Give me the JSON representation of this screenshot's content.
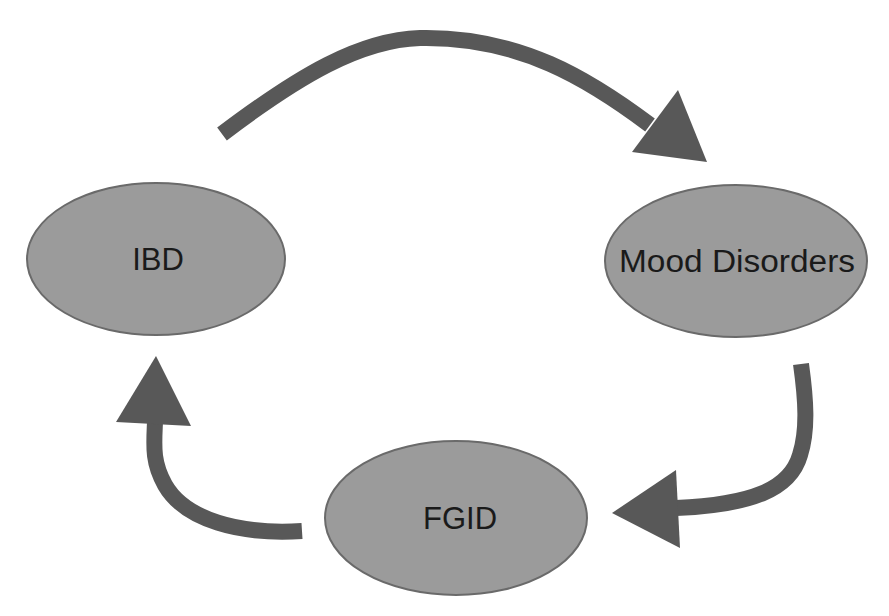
{
  "diagram": {
    "type": "cycle",
    "colors": {
      "node_fill": "#9b9b9b",
      "node_stroke": "#6a6a6a",
      "arrow": "#585858",
      "text": "#1a1a1a",
      "background": "#ffffff"
    },
    "nodes": [
      {
        "id": "ibd",
        "label": "IBD"
      },
      {
        "id": "mood",
        "label": "Mood Disorders"
      },
      {
        "id": "fgid",
        "label": "FGID"
      }
    ],
    "edges": [
      {
        "from": "IBD",
        "to": "Mood Disorders"
      },
      {
        "from": "Mood Disorders",
        "to": "FGID"
      },
      {
        "from": "FGID",
        "to": "IBD"
      }
    ]
  }
}
